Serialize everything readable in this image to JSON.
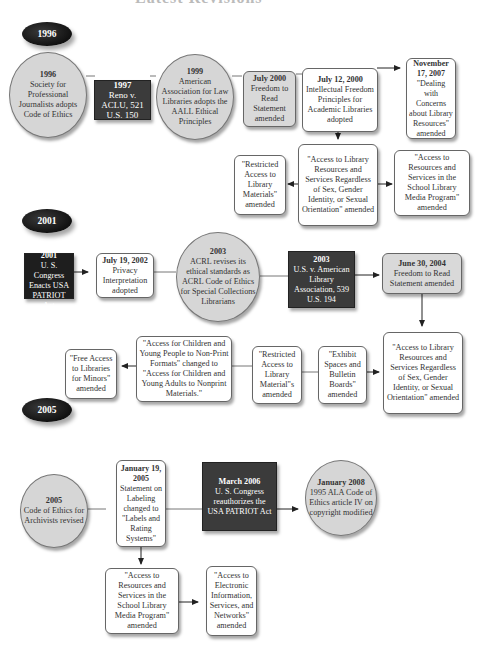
{
  "page_title_partial": "Latest Revisions",
  "sections": [
    {
      "year": "1996",
      "nodes": [
        {
          "id": "n1996",
          "date": "1996",
          "text": "Society for Professional Journalists adopts Code of Ethics"
        },
        {
          "id": "n1997",
          "date": "1997",
          "text": "Reno v. ACLU, 521 U.S. 150"
        },
        {
          "id": "n1999",
          "date": "1999",
          "text": "American Association for Law Libraries adopts the AALL Ethical Principles"
        },
        {
          "id": "njul2000",
          "date": "July 2000",
          "text": "Freedom to Read Statement amended"
        },
        {
          "id": "njul12",
          "date": "July 12, 2000",
          "text": "Intellectual Freedom Principles for Academic Libraries adopted"
        },
        {
          "id": "nnov2007",
          "date": "November 17, 2007",
          "text": "\"Dealing with Concerns about Library Resources\" amended"
        },
        {
          "id": "nrestricted1",
          "date": "",
          "text": "\"Restricted Access to Library Materials\" amended"
        },
        {
          "id": "naccess1",
          "date": "",
          "text": "\"Access to Library Resources and Services Regardless of Sex, Gender Identity, or Sexual Orientation\" amended"
        },
        {
          "id": "nschool1",
          "date": "",
          "text": "\"Access to Resources and Services in the School Library Media Program\" amended"
        }
      ]
    },
    {
      "year": "2001",
      "nodes": [
        {
          "id": "noct2001",
          "date": "October 2001",
          "text": "U. S. Congress Enacts USA PATRIOT Act"
        },
        {
          "id": "njul2002",
          "date": "July 19, 2002",
          "text": "Privacy Interpretation adopted"
        },
        {
          "id": "n2003a",
          "date": "2003",
          "text": "ACRL revises its ethical standards as ACRL Code of Ethics for Special Collections Librarians"
        },
        {
          "id": "n2003b",
          "date": "2003",
          "text": "U.S. v. American Library Association, 539 U.S. 194"
        },
        {
          "id": "njun2004",
          "date": "June 30, 2004",
          "text": "Freedom to Read Statement amended"
        },
        {
          "id": "naccess2",
          "date": "",
          "text": "\"Access to Library Resources and Services Regardless of Sex, Gender Identity, or Sexual Orientation\" amended"
        },
        {
          "id": "nexhibit",
          "date": "",
          "text": "\"Exhibit Spaces and Bulletin Boards\" amended"
        },
        {
          "id": "nrestricted2",
          "date": "",
          "text": "\"Restricted Access to Library Material\"s amended"
        },
        {
          "id": "nchildren",
          "date": "",
          "text": "\"Access for Children and Young People to Non-Print Formats\" changed to \"Access for Children and Young Adults to Nonprint Materials.\""
        },
        {
          "id": "nminors",
          "date": "",
          "text": "\"Free Access to Libraries for Minors\" amended"
        }
      ]
    },
    {
      "year": "2005",
      "nodes": [
        {
          "id": "n2005",
          "date": "2005",
          "text": "Code of Ethics for Archivists revised"
        },
        {
          "id": "njan2005",
          "date": "January 19, 2005",
          "text": "Statement on Labeling changed to \"Labels and Rating Systems\""
        },
        {
          "id": "nmar2006",
          "date": "March 2006",
          "text": "U. S. Congress reauthorizes the USA PATRIOT Act"
        },
        {
          "id": "njan2008",
          "date": "January 2008",
          "text": "1995 ALA Code of Ethics article IV on copyright modified"
        },
        {
          "id": "nschool2",
          "date": "",
          "text": "\"Access to Resources and Services in the School Library Media Program\" amended"
        },
        {
          "id": "nelectronic",
          "date": "",
          "text": "\"Access to Electronic Information, Services, and Networks\" amended"
        }
      ]
    }
  ],
  "colors": {
    "circle_fill": "#d6d6d6",
    "dark_fill": "#3b3b3b",
    "gray_box": "#d9d9d9",
    "line": "#666666"
  }
}
